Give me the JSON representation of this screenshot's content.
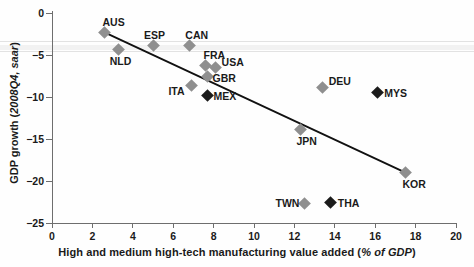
{
  "chart_data": {
    "type": "scatter",
    "title": "",
    "xlabel_plain": "High and medium high-tech manufacturing value added (",
    "xlabel_italic": "% of GDP",
    "xlabel_tail": ")",
    "xlabel_full": "High and medium high-tech manufacturing value added (% of GDP)",
    "ylabel_plain": "GDP growth (",
    "ylabel_italic": "2008Q4, saar",
    "ylabel_tail": ")",
    "ylabel_full": "GDP growth (2008Q4, saar)",
    "xlim": [
      0,
      20
    ],
    "ylim": [
      -25,
      0
    ],
    "xticks": [
      0,
      2,
      4,
      6,
      8,
      10,
      12,
      14,
      16,
      18,
      20
    ],
    "yticks": [
      0,
      -5,
      -10,
      -15,
      -20,
      -25
    ],
    "xtick_labels": [
      "0",
      "2",
      "4",
      "6",
      "8",
      "10",
      "12",
      "14",
      "16",
      "18",
      "20"
    ],
    "ytick_labels": [
      "0",
      "−5",
      "−10",
      "−15",
      "−20",
      "−25"
    ],
    "grid": false,
    "legend": "none",
    "points": [
      {
        "label": "AUS",
        "x": 2.6,
        "y": -2.3,
        "group": "advanced",
        "lx": -2,
        "ly": -15
      },
      {
        "label": "NLD",
        "x": 3.3,
        "y": -4.3,
        "group": "advanced",
        "lx": -9,
        "ly": 7
      },
      {
        "label": "ESP",
        "x": 5.0,
        "y": -3.9,
        "group": "advanced",
        "lx": -9,
        "ly": -16
      },
      {
        "label": "CAN",
        "x": 6.8,
        "y": -3.9,
        "group": "advanced",
        "lx": -4,
        "ly": -16
      },
      {
        "label": "FRA",
        "x": 7.6,
        "y": -6.2,
        "group": "advanced",
        "lx": -2,
        "ly": -15
      },
      {
        "label": "USA",
        "x": 8.1,
        "y": -6.5,
        "group": "advanced",
        "lx": 6,
        "ly": -11
      },
      {
        "label": "GBR",
        "x": 7.7,
        "y": -7.6,
        "group": "advanced",
        "lx": 5,
        "ly": -4
      },
      {
        "label": "ITA",
        "x": 6.9,
        "y": -8.6,
        "group": "advanced",
        "lx": -23,
        "ly": 1
      },
      {
        "label": "MEX",
        "x": 7.7,
        "y": -9.8,
        "group": "emerging",
        "lx": 6,
        "ly": -4
      },
      {
        "label": "DEU",
        "x": 13.4,
        "y": -8.9,
        "group": "advanced",
        "lx": 6,
        "ly": -12
      },
      {
        "label": "MYS",
        "x": 16.1,
        "y": -9.5,
        "group": "emerging",
        "lx": 7,
        "ly": -5
      },
      {
        "label": "JPN",
        "x": 12.3,
        "y": -13.9,
        "group": "advanced",
        "lx": -4,
        "ly": 6
      },
      {
        "label": "KOR",
        "x": 17.5,
        "y": -19.0,
        "group": "advanced",
        "lx": -3,
        "ly": 6
      },
      {
        "label": "TWN",
        "x": 12.5,
        "y": -22.7,
        "group": "advanced",
        "lx": -29,
        "ly": -6
      },
      {
        "label": "THA",
        "x": 13.8,
        "y": -22.6,
        "group": "emerging",
        "lx": 7,
        "ly": -5
      }
    ],
    "trendline": {
      "x0": 2.6,
      "y0": -2.3,
      "x1": 17.5,
      "y1": -19.0
    },
    "colors": {
      "advanced_marker": "#8f8f8f",
      "emerging_marker": "#1b1b1b",
      "axis": "#6e6e6e",
      "trendline": "#111111"
    }
  }
}
